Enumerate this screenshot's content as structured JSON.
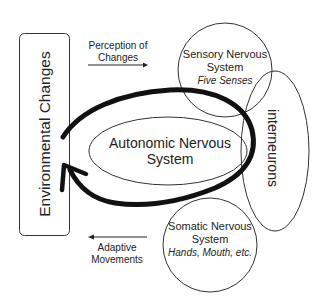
{
  "diagram": {
    "environment_box": {
      "label": "Environmental Changes"
    },
    "perception_arrow": {
      "line1": "Perception of",
      "line2": "Changes"
    },
    "adaptive_arrow": {
      "line1": "Adaptive",
      "line2": "Movements"
    },
    "sensory": {
      "line1": "Sensory Nervous",
      "line2": "System",
      "line3": "Five Senses"
    },
    "interneurons": {
      "label": "interneurons"
    },
    "autonomic": {
      "line1": "Autonomic Nervous",
      "line2": "System"
    },
    "somatic": {
      "line1": "Somatic Nervous",
      "line2": "System",
      "line3": "Hands, Mouth, etc."
    },
    "colors": {
      "stroke": "#222222",
      "loop": "#111111",
      "background": "#ffffff"
    }
  }
}
